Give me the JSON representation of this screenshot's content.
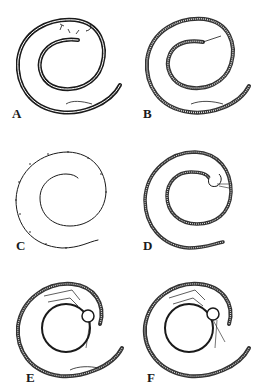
{
  "figure": {
    "panels": [
      {
        "id": "A",
        "label": "A"
      },
      {
        "id": "B",
        "label": "B"
      },
      {
        "id": "C",
        "label": "C"
      },
      {
        "id": "D",
        "label": "D"
      },
      {
        "id": "E",
        "label": "E"
      },
      {
        "id": "F",
        "label": "F"
      }
    ],
    "colors": {
      "ink": "#1a1a1a",
      "background": "#ffffff"
    }
  }
}
